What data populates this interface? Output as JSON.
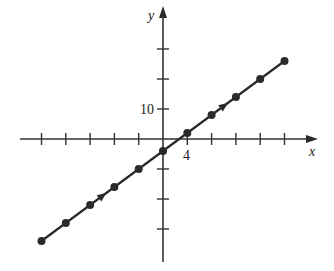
{
  "chart_data": {
    "type": "line",
    "title": "",
    "xlabel": "x",
    "ylabel": "y",
    "tick_labels": {
      "x": [
        "4"
      ],
      "y": [
        "10"
      ]
    },
    "x_tick_step": 4,
    "y_tick_step": 10,
    "xlim": [
      -20,
      20
    ],
    "ylim": [
      -34,
      26
    ],
    "grid": false,
    "legend": null,
    "series": [
      {
        "name": "y = 1.5x - 4",
        "x": [
          -20,
          -16,
          -12,
          -8,
          -4,
          0,
          4,
          8,
          12,
          16,
          20
        ],
        "y": [
          -34,
          -28,
          -22,
          -16,
          -10,
          -4,
          2,
          8,
          14,
          20,
          26
        ],
        "markers": true,
        "direction_arrows_at_x": [
          -10,
          10
        ]
      }
    ]
  },
  "labels": {
    "x_axis": "x",
    "y_axis": "y",
    "x_tick": "4",
    "y_tick": "10"
  },
  "colors": {
    "ink": "#2a2a2a",
    "background": "#ffffff"
  }
}
